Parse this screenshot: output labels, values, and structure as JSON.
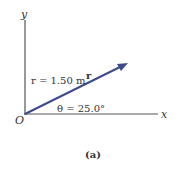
{
  "diagram": {
    "axes": {
      "y_label": "y",
      "x_label": "x",
      "origin_label": "O"
    },
    "vector": {
      "name": "r",
      "magnitude_label": "r = 1.50 m",
      "angle_label": "θ = 25.0°",
      "color": "#3d4b8c"
    },
    "caption": "(a)"
  }
}
